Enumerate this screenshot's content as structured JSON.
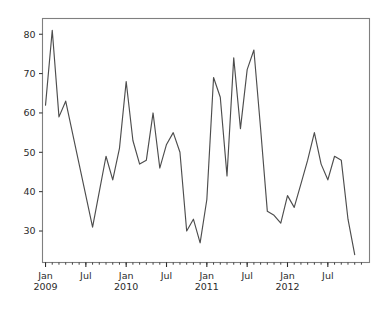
{
  "chart_data": {
    "type": "line",
    "title": "",
    "xlabel": "",
    "ylabel": "",
    "ylim": [
      22,
      84
    ],
    "xlim": [
      "2008-12-15",
      "2012-12-15"
    ],
    "grid": false,
    "legend": null,
    "line_color": "#4d4d4d",
    "x": [
      "2009-01",
      "2009-02",
      "2009-03",
      "2009-04",
      "2009-05",
      "2009-06",
      "2009-07",
      "2009-08",
      "2009-09",
      "2009-10",
      "2009-11",
      "2009-12",
      "2010-01",
      "2010-02",
      "2010-03",
      "2010-04",
      "2010-05",
      "2010-06",
      "2010-07",
      "2010-08",
      "2010-09",
      "2010-10",
      "2010-11",
      "2010-12",
      "2011-01",
      "2011-02",
      "2011-03",
      "2011-04",
      "2011-05",
      "2011-06",
      "2011-07",
      "2011-08",
      "2011-09",
      "2011-10",
      "2011-11",
      "2011-12",
      "2012-01",
      "2012-02",
      "2012-03",
      "2012-04",
      "2012-05",
      "2012-06",
      "2012-07",
      "2012-08",
      "2012-09",
      "2012-10",
      "2012-11"
    ],
    "values": [
      62,
      81,
      59,
      63,
      55,
      47,
      39,
      31,
      40,
      49,
      43,
      51,
      68,
      53,
      47,
      48,
      60,
      46,
      52,
      55,
      50,
      30,
      33,
      27,
      38,
      69,
      64,
      44,
      74,
      56,
      71,
      76,
      56,
      35,
      34,
      32,
      39,
      36,
      42,
      48,
      55,
      47,
      43,
      49,
      48,
      33,
      24
    ],
    "yticks": [
      30,
      40,
      50,
      60,
      70,
      80
    ],
    "ytick_labels": [
      "30",
      "40",
      "50",
      "60",
      "70",
      "80"
    ],
    "xticks_major": [
      {
        "pos": "2009-01",
        "label_top": "Jan",
        "label_bottom": "2009"
      },
      {
        "pos": "2009-07",
        "label_top": "Jul",
        "label_bottom": ""
      },
      {
        "pos": "2010-01",
        "label_top": "Jan",
        "label_bottom": "2010"
      },
      {
        "pos": "2010-07",
        "label_top": "Jul",
        "label_bottom": ""
      },
      {
        "pos": "2011-01",
        "label_top": "Jan",
        "label_bottom": "2011"
      },
      {
        "pos": "2011-07",
        "label_top": "Jul",
        "label_bottom": ""
      },
      {
        "pos": "2012-01",
        "label_top": "Jan",
        "label_bottom": "2012"
      },
      {
        "pos": "2012-07",
        "label_top": "Jul",
        "label_bottom": ""
      }
    ]
  },
  "figure": {
    "background_color": "#ffffff",
    "axes_edge_color": "#7f7f7f"
  }
}
